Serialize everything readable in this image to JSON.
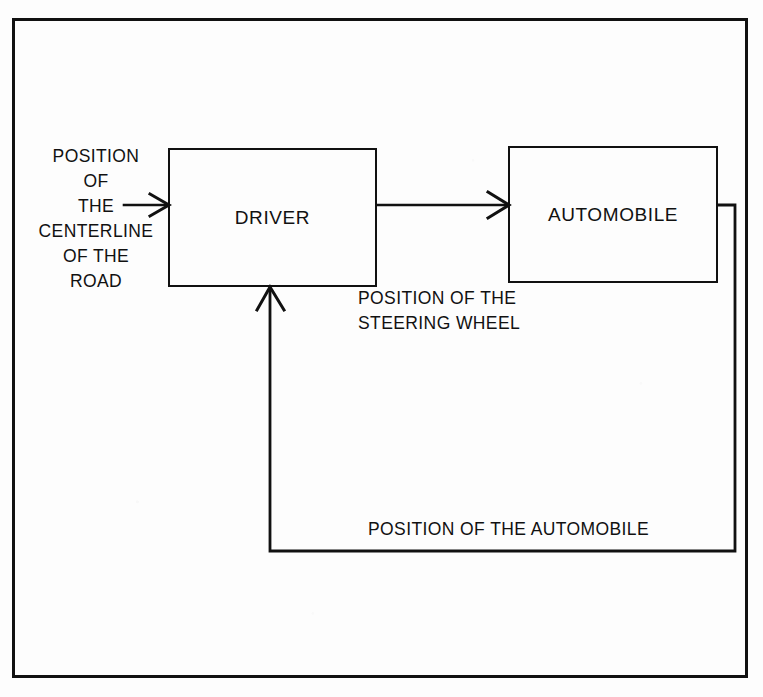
{
  "diagram": {
    "frame": {
      "name": "outer-border"
    },
    "colors": {
      "ink": "#111111",
      "paper": "#fdfdfd"
    },
    "nodes": [
      {
        "id": "driver",
        "label": "DRIVER"
      },
      {
        "id": "automobile",
        "label": "AUTOMOBILE"
      }
    ],
    "labels": {
      "input": {
        "lines": [
          "POSITION",
          "OF",
          "THE",
          "CENTERLINE",
          "OF THE",
          "ROAD"
        ],
        "full_text": "POSITION OF THE CENTERLINE OF THE ROAD"
      },
      "forward_signal": {
        "lines": [
          "POSITION OF THE",
          "STEERING WHEEL"
        ],
        "full_text": "POSITION OF THE STEERING WHEEL"
      },
      "feedback_signal": {
        "text": "POSITION OF THE AUTOMOBILE"
      }
    },
    "edges": [
      {
        "id": "input-to-driver",
        "from": "input-label",
        "to": "driver",
        "arrowhead": "open-v",
        "direction": "right"
      },
      {
        "id": "driver-to-automobile",
        "from": "driver",
        "to": "automobile",
        "arrowhead": "open-v",
        "direction": "right"
      },
      {
        "id": "automobile-feedback-to-driver",
        "from": "automobile",
        "to": "driver",
        "arrowhead": "open-v",
        "direction": "up",
        "routing": "right-down-left-up"
      }
    ]
  }
}
